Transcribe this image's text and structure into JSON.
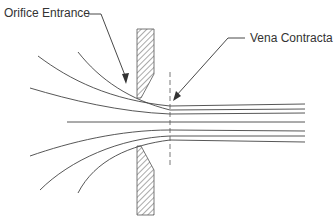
{
  "diagram": {
    "labels": {
      "orifice_entrance": "Orifice Entrance",
      "vena_contracta": "Vena Contracta"
    },
    "colors": {
      "line": "#444444",
      "hatch": "#555555",
      "text": "#333333",
      "background": "#ffffff"
    }
  }
}
